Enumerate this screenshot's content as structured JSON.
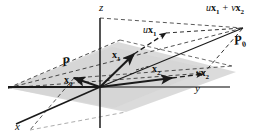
{
  "figure": {
    "kind": "3d-vector-diagram",
    "background_color": "#ffffff",
    "plane_fill_color": "#d8d8d8",
    "line_color": "#1a1a1a",
    "axes": {
      "x_label": "x",
      "y_label": "y",
      "z_label": "z"
    },
    "origin_label": "",
    "vectors": [
      {
        "name": "x0",
        "label_u": "",
        "label_bold": "x",
        "label_sub": "0",
        "style": "solid"
      },
      {
        "name": "x1",
        "label_u": "",
        "label_bold": "x",
        "label_sub": "1",
        "style": "solid"
      },
      {
        "name": "x2",
        "label_u": "",
        "label_bold": "x",
        "label_sub": "2",
        "style": "solid"
      },
      {
        "name": "ux1",
        "label_u": "u",
        "label_bold": "x",
        "label_sub": "1",
        "style": "dashed"
      },
      {
        "name": "vx2",
        "label_u": "v",
        "label_bold": "x",
        "label_sub": "2",
        "style": "dashed"
      }
    ],
    "labels": {
      "ux1": {
        "scalar": "u",
        "vector": "x",
        "sub": "1"
      },
      "vx2": {
        "scalar": "v",
        "vector": "x",
        "sub": "2"
      },
      "x0": {
        "scalar": "",
        "vector": "x",
        "sub": "0"
      },
      "x1": {
        "scalar": "",
        "vector": "x",
        "sub": "1"
      },
      "x2": {
        "scalar": "",
        "vector": "x",
        "sub": "2"
      },
      "sum": {
        "term1_scalar": "u",
        "term1_vector": "x",
        "term1_sub": "1",
        "operator": "+",
        "term2_scalar": "v",
        "term2_vector": "x",
        "term2_sub": "2"
      },
      "plane_p": {
        "symbol": "P",
        "sub": ""
      },
      "plane_p0": {
        "symbol": "P",
        "sub": "0"
      }
    }
  }
}
